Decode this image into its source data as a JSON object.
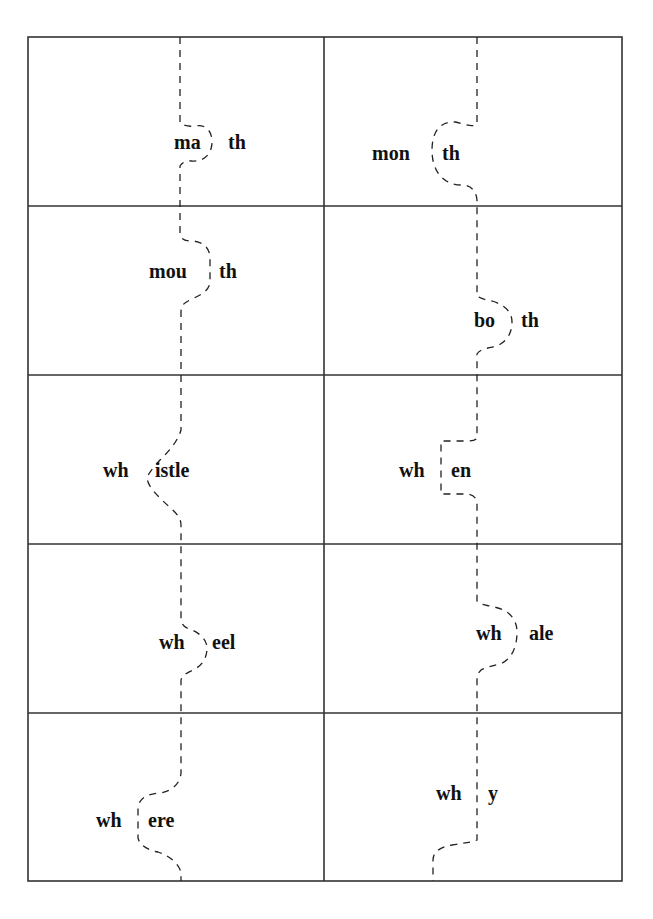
{
  "worksheet": {
    "title": "",
    "layout": {
      "rows": 5,
      "columns": 2
    },
    "cards": [
      {
        "row": 1,
        "col": 1,
        "left": "ma",
        "right": "th",
        "word": "math"
      },
      {
        "row": 1,
        "col": 2,
        "left": "mon",
        "right": "th",
        "word": "month"
      },
      {
        "row": 2,
        "col": 1,
        "left": "mou",
        "right": "th",
        "word": "mouth"
      },
      {
        "row": 2,
        "col": 2,
        "left": "bo",
        "right": "th",
        "word": "both"
      },
      {
        "row": 3,
        "col": 1,
        "left": "wh",
        "right": "istle",
        "word": "whistle"
      },
      {
        "row": 3,
        "col": 2,
        "left": "wh",
        "right": "en",
        "word": "when"
      },
      {
        "row": 4,
        "col": 1,
        "left": "wh",
        "right": "eel",
        "word": "wheel"
      },
      {
        "row": 4,
        "col": 2,
        "left": "wh",
        "right": "ale",
        "word": "whale"
      },
      {
        "row": 5,
        "col": 1,
        "left": "wh",
        "right": "ere",
        "word": "where"
      },
      {
        "row": 5,
        "col": 2,
        "left": "wh",
        "right": "y",
        "word": "why"
      }
    ],
    "colors": {
      "line": "#333333",
      "text": "#111111",
      "background": "#ffffff"
    }
  }
}
